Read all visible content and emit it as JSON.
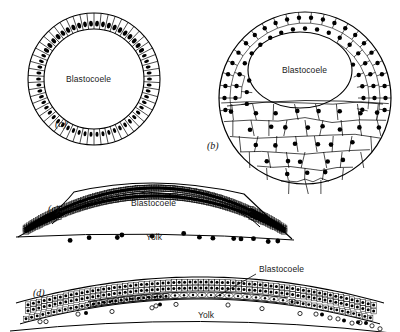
{
  "figure": {
    "kind": "biology-diagram",
    "ink_color": "#000000",
    "background_color": "#ffffff",
    "panels": [
      {
        "key": "a",
        "panel_label": "(a)",
        "label_x": 55,
        "label_y": 118,
        "type": "spherical-blastula-columnar",
        "cavity_label": "Blastocoele",
        "cavity_label_x": 66,
        "cavity_label_y": 74,
        "circle": {
          "cx": 94,
          "cy": 79,
          "r_outer": 66,
          "r_inner": 50
        },
        "cell_count": 58,
        "nucleus_shape": "oval",
        "dense_arc_start_deg": 205,
        "dense_arc_end_deg": 335
      },
      {
        "key": "b",
        "panel_label": "(b)",
        "label_x": 207,
        "label_y": 140,
        "type": "spherical-blastula-polygonal",
        "cavity_label": "Blastocoele",
        "cavity_label_x": 282,
        "cavity_label_y": 65,
        "circle": {
          "cx": 305,
          "cy": 98,
          "r_outer": 86
        },
        "cavity": {
          "cx": 300,
          "cy": 70,
          "rx": 52,
          "ry": 38
        },
        "small_cell_count": 96,
        "large_cell_count": 52,
        "nucleus_shape": "round"
      },
      {
        "key": "c",
        "panel_label": "(c)",
        "label_x": 48,
        "label_y": 203,
        "type": "discoidal-blastula-domed",
        "cavity_label": "Blastocoele",
        "cavity_label_x": 131,
        "cavity_label_y": 198,
        "yolk_label": "Yolk",
        "yolk_label_x": 146,
        "yolk_label_y": 232,
        "dome_left_x": 48,
        "dome_right_x": 262,
        "dome_apex_y": 180,
        "floor_y": 221,
        "yolk_nuclei_count": 13
      },
      {
        "key": "d",
        "panel_label": "(d)",
        "label_x": 33,
        "label_y": 287,
        "type": "discoidal-blastula-flattened",
        "cavity_label": "Blastocoele",
        "cavity_label_x": 259,
        "cavity_label_y": 264,
        "cavity_leader": {
          "x1": 256,
          "y1": 274,
          "x2": 214,
          "y2": 298
        },
        "yolk_label": "Yolk",
        "yolk_label_x": 198,
        "yolk_label_y": 310,
        "cap_left_x": 16,
        "cap_right_x": 384,
        "cap_apex_y": 277,
        "open_circle_count": 17,
        "filled_circle_count": 6
      }
    ]
  }
}
